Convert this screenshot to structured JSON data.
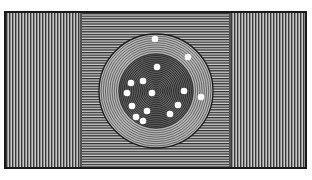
{
  "caption_fragment": "",
  "figure": {
    "colors": {
      "ink": "#1a1a1a",
      "paper": "#ffffff",
      "panel_light": "#8a8a8a",
      "panel_mid": "#6e6e6e",
      "disc_outer": "#9a9a9a",
      "disc_inner": "#4a4a4a",
      "dot": "#ffffff"
    },
    "panels": [
      {
        "name": "left-panel",
        "shading": "vertical-lines"
      },
      {
        "name": "center-panel",
        "shading": "horizontal-lines"
      },
      {
        "name": "right-panel",
        "shading": "vertical-lines"
      }
    ],
    "dot_count": 15
  }
}
